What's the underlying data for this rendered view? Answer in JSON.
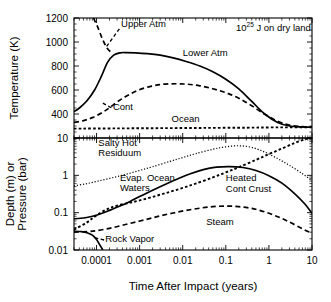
{
  "figure": {
    "annotation": {
      "base": "10",
      "exponent": "25",
      "rest": " J on dry land"
    },
    "xaxis": {
      "title": "Time After Impact (years)",
      "scale": "log",
      "ticks": [
        "0.0001",
        "0.001",
        "0.01",
        "0.1",
        "1",
        "10"
      ],
      "range": [
        3e-05,
        10
      ]
    }
  },
  "chart_data": [
    {
      "type": "line",
      "panel": "top",
      "title": "",
      "xlabel": "Time After Impact (years)",
      "ylabel": "Temperature (K)",
      "xscale": "log",
      "yscale": "linear",
      "xlim": [
        3e-05,
        10
      ],
      "ylim": [
        200,
        1200
      ],
      "xticks": [
        0.0001,
        0.001,
        0.01,
        0.1,
        1,
        10
      ],
      "yticks": [
        400,
        600,
        800,
        1000,
        1200
      ],
      "ytick_labels": [
        "400",
        "600",
        "800",
        "1000",
        "1200"
      ],
      "grid": false,
      "legend": "inline-annotations",
      "annotations": [
        {
          "text": "10^25 J on dry land",
          "x": 0.6,
          "y": 1130
        },
        {
          "text": "Upper Atm",
          "x": 0.00032,
          "y": 1130,
          "style": "dashed-leader"
        },
        {
          "text": "Lower Atm",
          "x": 0.012,
          "y": 880,
          "style": "solid"
        },
        {
          "text": "Cont",
          "x": 0.00022,
          "y": 435,
          "style": "dashed"
        },
        {
          "text": "Ocean",
          "x": 0.006,
          "y": 330,
          "style": "dotted"
        }
      ],
      "series": [
        {
          "name": "Upper Atm",
          "style": "dashed",
          "comment": "steep leader rising off top of panel near 1e-4",
          "x": [
            8.5e-05,
            0.000105,
            0.000135,
            0.000175,
            0.00023
          ],
          "y": [
            1200,
            1130,
            1030,
            950,
            905
          ]
        },
        {
          "name": "Lower Atm",
          "style": "solid",
          "x": [
            3e-05,
            4e-05,
            6e-05,
            9e-05,
            0.00013,
            0.00018,
            0.00025,
            0.00035,
            0.0005,
            0.0008,
            0.0015,
            0.003,
            0.006,
            0.012,
            0.025,
            0.05,
            0.1,
            0.2,
            0.4,
            0.8,
            1.6,
            3.0,
            6.0,
            10.0
          ],
          "y": [
            420,
            450,
            510,
            600,
            715,
            830,
            890,
            910,
            912,
            910,
            903,
            890,
            868,
            838,
            800,
            752,
            690,
            610,
            505,
            400,
            330,
            300,
            292,
            290
          ]
        },
        {
          "name": "Cont",
          "style": "dashed",
          "x": [
            3e-05,
            5e-05,
            8e-05,
            0.00013,
            0.0002,
            0.0003,
            0.0005,
            0.0009,
            0.0018,
            0.0035,
            0.007,
            0.013,
            0.025,
            0.05,
            0.1,
            0.2,
            0.4,
            0.8,
            1.6,
            3.0,
            6.0,
            10.0
          ],
          "y": [
            330,
            345,
            370,
            408,
            452,
            500,
            550,
            597,
            630,
            648,
            652,
            648,
            635,
            610,
            578,
            532,
            468,
            398,
            340,
            308,
            295,
            292
          ]
        },
        {
          "name": "Ocean",
          "style": "dotted",
          "x": [
            3e-05,
            0.0003,
            0.003,
            0.03,
            0.3,
            1.0,
            3.0,
            10.0
          ],
          "y": [
            278,
            280,
            282,
            284,
            286,
            288,
            289,
            290
          ]
        }
      ]
    },
    {
      "type": "line",
      "panel": "bottom",
      "title": "",
      "xlabel": "Time After Impact (years)",
      "ylabel": "Depth (m) or Pressure (bar)",
      "xscale": "log",
      "yscale": "log",
      "xlim": [
        3e-05,
        10
      ],
      "ylim": [
        0.01,
        10
      ],
      "xticks": [
        0.0001,
        0.001,
        0.01,
        0.1,
        1,
        10
      ],
      "yticks": [
        0.01,
        0.1,
        1,
        10
      ],
      "ytick_labels": [
        "0.01",
        "0.1",
        "1",
        "10"
      ],
      "grid": false,
      "legend": "inline-annotations",
      "annotations": [
        {
          "text": "Salty Hot Residuum",
          "x": 0.00012,
          "y": 5.2,
          "style": "fine-dotted"
        },
        {
          "text": "Evap. Ocean Waters",
          "x": 0.0007,
          "y": 0.62,
          "style": "dotted"
        },
        {
          "text": "Heated Cont Crust",
          "x": 0.09,
          "y": 0.52,
          "style": "solid"
        },
        {
          "text": "Steam",
          "x": 0.03,
          "y": 0.048,
          "style": "dashed"
        },
        {
          "text": "Rock Vapor",
          "x": 0.0002,
          "y": 0.017,
          "style": "solid"
        }
      ],
      "series": [
        {
          "name": "Salty Hot Residuum",
          "style": "fine-dotted",
          "x": [
            3e-05,
            6e-05,
            0.00012,
            0.00025,
            0.0005,
            0.001,
            0.002,
            0.005,
            0.01,
            0.02,
            0.05,
            0.1,
            0.2,
            0.4,
            0.8,
            1.6,
            3.0,
            6.0,
            10.0
          ],
          "y": [
            0.52,
            0.6,
            0.72,
            0.88,
            1.08,
            1.35,
            1.7,
            2.35,
            3.0,
            3.8,
            5.0,
            5.8,
            6.2,
            5.6,
            4.2,
            2.8,
            1.85,
            1.1,
            0.72
          ]
        },
        {
          "name": "Evap. Ocean Waters",
          "style": "dotted",
          "x": [
            3e-05,
            6e-05,
            0.0001,
            0.00018,
            0.0003,
            0.0006,
            0.0012,
            0.0025,
            0.005,
            0.01,
            0.02,
            0.05,
            0.1,
            0.2,
            0.5,
            1.0,
            2.0,
            4.0,
            7.0,
            10.0
          ],
          "y": [
            0.035,
            0.055,
            0.085,
            0.125,
            0.155,
            0.185,
            0.225,
            0.285,
            0.36,
            0.46,
            0.6,
            0.88,
            1.2,
            1.65,
            2.6,
            3.7,
            5.2,
            7.4,
            9.3,
            10.5
          ]
        },
        {
          "name": "Heated Cont Crust",
          "style": "solid",
          "x": [
            3e-05,
            5e-05,
            8e-05,
            0.00013,
            0.0002,
            0.00035,
            0.0006,
            0.001,
            0.002,
            0.004,
            0.008,
            0.015,
            0.03,
            0.06,
            0.12,
            0.25,
            0.5,
            1.0,
            2.0,
            4.0,
            7.0,
            10.0
          ],
          "y": [
            0.068,
            0.072,
            0.08,
            0.095,
            0.115,
            0.15,
            0.2,
            0.27,
            0.4,
            0.58,
            0.82,
            1.1,
            1.42,
            1.65,
            1.72,
            1.62,
            1.35,
            0.98,
            0.62,
            0.32,
            0.165,
            0.095
          ]
        },
        {
          "name": "Steam",
          "style": "dashed",
          "x": [
            3e-05,
            6e-05,
            0.0001,
            0.0002,
            0.0004,
            0.0008,
            0.0016,
            0.003,
            0.006,
            0.012,
            0.025,
            0.05,
            0.1,
            0.2,
            0.4,
            0.8,
            1.6,
            3.0,
            6.0,
            10.0
          ],
          "y": [
            0.03,
            0.031,
            0.033,
            0.038,
            0.046,
            0.056,
            0.068,
            0.082,
            0.098,
            0.115,
            0.132,
            0.145,
            0.15,
            0.145,
            0.13,
            0.105,
            0.078,
            0.056,
            0.037,
            0.028
          ]
        },
        {
          "name": "Rock Vapor",
          "style": "solid",
          "x": [
            3e-05,
            4.5e-05,
            6e-05,
            8e-05,
            0.0001,
            0.00012,
            0.00014
          ],
          "y": [
            0.032,
            0.031,
            0.029,
            0.025,
            0.019,
            0.0135,
            0.01
          ]
        }
      ]
    }
  ]
}
